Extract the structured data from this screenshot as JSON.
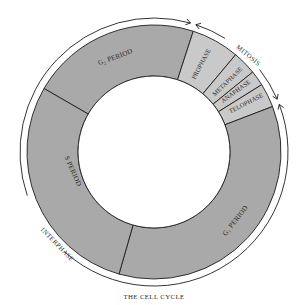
{
  "title": "THE CELL CYCLE",
  "geometry": {
    "cx": 154,
    "cy": 152,
    "r_inner": 76,
    "r_outer": 127,
    "r_arc": 134
  },
  "colors": {
    "interphase_fill": "#a9a9a9",
    "mitosis_fill": "#c9c9c9",
    "stroke": "#1e1e1e",
    "background": "#ffffff",
    "center": "#ffffff"
  },
  "segments": [
    {
      "id": "g2",
      "label": "G₂ PERIOD",
      "group": "interphase",
      "start": 300,
      "end": 18
    },
    {
      "id": "prophase",
      "label": "PROPHASE",
      "group": "mitosis",
      "start": 18,
      "end": 40
    },
    {
      "id": "metaphase",
      "label": "METAPHASE",
      "group": "mitosis",
      "start": 40,
      "end": 51
    },
    {
      "id": "anaphase",
      "label": "ANAPHASE",
      "group": "mitosis",
      "start": 51,
      "end": 58
    },
    {
      "id": "telophase",
      "label": "TELOPHASE",
      "group": "mitosis",
      "start": 58,
      "end": 69
    },
    {
      "id": "g1",
      "label": "G₁ PERIOD",
      "group": "interphase",
      "start": 69,
      "end": 196
    },
    {
      "id": "s",
      "label": "S PERIOD",
      "group": "interphase",
      "start": 196,
      "end": 300
    }
  ],
  "labels": {
    "g2": {
      "text": "G₂ PERIOD",
      "x": 116,
      "y": 59,
      "rotate": -20
    },
    "s": {
      "text": "S PERIOD",
      "x": 71,
      "y": 172,
      "rotate": 66
    },
    "g1": {
      "text": "G₁ PERIOD",
      "x": 237,
      "y": 222,
      "rotate": -52
    },
    "prophase": {
      "text": "PROPHASE",
      "x": 203,
      "y": 65,
      "rotate": -62
    },
    "metaphase": {
      "text": "METAPHASE",
      "x": 229,
      "y": 83,
      "rotate": -44
    },
    "anaphase": {
      "text": "ANAPHASE",
      "x": 237,
      "y": 93,
      "rotate": -36
    },
    "telophase": {
      "text": "TELOPHASE",
      "x": 247,
      "y": 105,
      "rotate": -27
    }
  },
  "outer_arcs": {
    "mitosis": {
      "label": "MITOSIS",
      "start": 17,
      "end": 68,
      "gap_start": 32,
      "gap_end": 52,
      "label_x": 247,
      "label_y": 57,
      "label_rotate": 40
    },
    "interphase": {
      "label": "INTERPHASE",
      "start": 68,
      "end": 377,
      "gap_start": 222,
      "gap_end": 251,
      "label_x": 56,
      "label_y": 246,
      "label_rotate": 46
    }
  },
  "caption": {
    "text": "THE CELL CYCLE",
    "x": 154,
    "y": 299
  }
}
